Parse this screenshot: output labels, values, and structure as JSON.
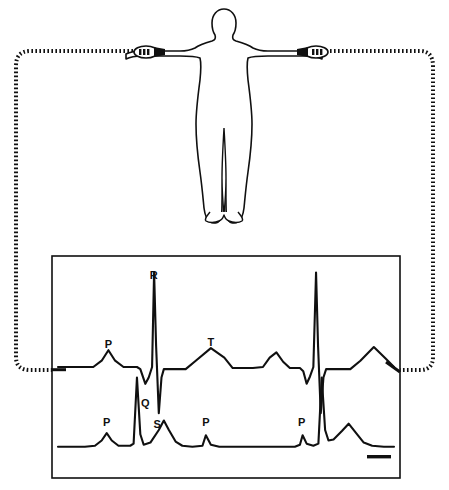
{
  "figure": {
    "subject": {
      "name": "human-body-outline",
      "posture": "standing, arms extended horizontally",
      "stroke_color": "#101010"
    },
    "electrodes": [
      {
        "label": "",
        "site": "left-wrist",
        "name": "electrode-left-wrist"
      },
      {
        "label": "",
        "site": "right-wrist",
        "name": "electrode-right-wrist"
      }
    ],
    "cable": {
      "style": "dotted",
      "color": "#101010",
      "description": "lead wires routed from both wrists around to the recorder"
    },
    "recorder": {
      "name": "ecg-recorder-panel",
      "border_color": "#101010",
      "background": "#ffffff"
    }
  },
  "chart_data": {
    "type": "line",
    "title": "",
    "xlabel": "",
    "ylabel": "",
    "grid": false,
    "legend": "none",
    "xlim": [
      0,
      100
    ],
    "ylim": [
      0,
      100
    ],
    "annotations": [
      {
        "text": "R",
        "x": 28.5,
        "y": 92,
        "series": "upper-trace"
      },
      {
        "text": "P",
        "x": 15.0,
        "y": 59,
        "series": "upper-trace"
      },
      {
        "text": "Q",
        "x": 26.0,
        "y": 31,
        "series": "upper-trace"
      },
      {
        "text": "S",
        "x": 29.5,
        "y": 21,
        "series": "upper-trace"
      },
      {
        "text": "T",
        "x": 45.5,
        "y": 60,
        "series": "upper-trace"
      },
      {
        "text": "P",
        "x": 14.5,
        "y": 22,
        "series": "lower-trace"
      },
      {
        "text": "P",
        "x": 44.0,
        "y": 22,
        "series": "lower-trace"
      },
      {
        "text": "P",
        "x": 72.5,
        "y": 22,
        "series": "lower-trace"
      }
    ],
    "series": [
      {
        "name": "upper-trace",
        "label": "Standard ECG trace (lead I)",
        "color": "#101010",
        "baseline": 50,
        "points": [
          [
            0.0,
            50.0
          ],
          [
            6.0,
            50.0
          ],
          [
            10.5,
            50.0
          ],
          [
            13.0,
            53.0
          ],
          [
            15.0,
            58.0
          ],
          [
            17.0,
            53.0
          ],
          [
            19.5,
            50.0
          ],
          [
            23.5,
            50.0
          ],
          [
            24.5,
            49.0
          ],
          [
            26.0,
            42.0
          ],
          [
            27.0,
            45.0
          ],
          [
            28.0,
            50.0
          ],
          [
            28.6,
            95.0
          ],
          [
            29.2,
            60.0
          ],
          [
            30.0,
            28.0
          ],
          [
            30.8,
            45.0
          ],
          [
            31.5,
            49.0
          ],
          [
            34.0,
            49.0
          ],
          [
            38.0,
            49.0
          ],
          [
            41.0,
            53.0
          ],
          [
            45.5,
            59.0
          ],
          [
            49.5,
            54.5
          ],
          [
            52.0,
            49.5
          ],
          [
            58.0,
            49.5
          ],
          [
            61.0,
            50.0
          ],
          [
            63.0,
            54.5
          ],
          [
            65.0,
            57.0
          ],
          [
            67.0,
            52.5
          ],
          [
            69.0,
            49.5
          ],
          [
            72.0,
            49.5
          ],
          [
            73.0,
            48.0
          ],
          [
            74.0,
            42.0
          ],
          [
            75.0,
            45.5
          ],
          [
            76.0,
            50.0
          ],
          [
            76.8,
            95.0
          ],
          [
            77.4,
            60.0
          ],
          [
            78.2,
            28.0
          ],
          [
            79.0,
            45.0
          ],
          [
            79.8,
            49.0
          ],
          [
            83.0,
            49.0
          ],
          [
            87.0,
            49.0
          ],
          [
            90.0,
            53.0
          ],
          [
            94.0,
            59.5
          ],
          [
            97.5,
            54.0
          ],
          [
            100.0,
            50.0
          ]
        ]
      },
      {
        "name": "lower-trace",
        "label": "Second ECG trace, reduced amplitude",
        "color": "#101010",
        "baseline": 12,
        "points": [
          [
            0.0,
            12.0
          ],
          [
            8.0,
            12.0
          ],
          [
            11.0,
            12.5
          ],
          [
            13.0,
            15.0
          ],
          [
            14.5,
            18.5
          ],
          [
            16.0,
            15.0
          ],
          [
            18.0,
            12.5
          ],
          [
            21.5,
            12.5
          ],
          [
            22.5,
            13.5
          ],
          [
            23.5,
            45.0
          ],
          [
            24.5,
            18.0
          ],
          [
            25.5,
            13.0
          ],
          [
            27.5,
            14.0
          ],
          [
            30.0,
            20.0
          ],
          [
            31.5,
            24.5
          ],
          [
            33.0,
            20.0
          ],
          [
            35.0,
            14.5
          ],
          [
            37.0,
            12.5
          ],
          [
            40.0,
            12.0
          ],
          [
            43.0,
            12.5
          ],
          [
            44.0,
            17.5
          ],
          [
            45.5,
            13.0
          ],
          [
            48.0,
            12.0
          ],
          [
            60.0,
            12.0
          ],
          [
            70.5,
            12.0
          ],
          [
            72.0,
            13.0
          ],
          [
            72.8,
            17.5
          ],
          [
            74.0,
            13.5
          ],
          [
            76.0,
            12.5
          ],
          [
            77.5,
            13.5
          ],
          [
            78.5,
            45.0
          ],
          [
            79.5,
            20.0
          ],
          [
            80.5,
            15.0
          ],
          [
            82.0,
            15.5
          ],
          [
            84.5,
            19.5
          ],
          [
            86.5,
            23.0
          ],
          [
            88.5,
            19.0
          ],
          [
            91.0,
            14.0
          ],
          [
            93.5,
            12.5
          ],
          [
            97.0,
            12.0
          ],
          [
            100.0,
            12.0
          ]
        ]
      }
    ]
  }
}
